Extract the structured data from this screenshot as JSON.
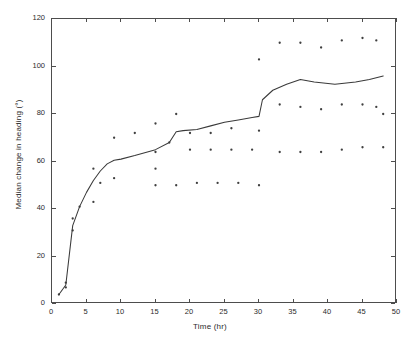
{
  "chart_data": {
    "type": "line",
    "title": "",
    "xlabel": "Time (hr)",
    "ylabel": "Median change in heading (°)",
    "xlim": [
      0,
      50
    ],
    "ylim": [
      0,
      120
    ],
    "xticks": [
      0,
      5,
      10,
      15,
      20,
      25,
      30,
      35,
      40,
      45,
      50
    ],
    "yticks": [
      0,
      20,
      40,
      60,
      80,
      100,
      120
    ],
    "grid": false,
    "legend": false,
    "legend_position": "none",
    "series": [
      {
        "name": "Median change in heading",
        "type": "line",
        "color": "#3a3a3a",
        "x": [
          1,
          2,
          3,
          4,
          5,
          6,
          7,
          8,
          9,
          10,
          12,
          15,
          17,
          18,
          19,
          21,
          23,
          25,
          27,
          29,
          30,
          30.5,
          32,
          34,
          36,
          38,
          41,
          44,
          46,
          48
        ],
        "y": [
          4,
          8,
          33,
          41,
          47,
          52,
          56,
          59,
          60.5,
          61,
          62.5,
          65,
          68,
          72.5,
          73,
          73.5,
          75,
          76.5,
          77.5,
          78.5,
          79,
          86,
          90,
          92.5,
          94.5,
          93.5,
          92.5,
          93.5,
          94.5,
          96
        ]
      },
      {
        "name": "Individual observations",
        "type": "scatter",
        "color": "#3f3f3f",
        "points": [
          [
            1,
            4
          ],
          [
            2,
            9
          ],
          [
            2,
            7
          ],
          [
            3,
            31
          ],
          [
            3,
            36
          ],
          [
            4,
            41
          ],
          [
            6,
            43
          ],
          [
            6,
            57
          ],
          [
            7,
            51
          ],
          [
            9,
            53
          ],
          [
            9,
            70
          ],
          [
            12,
            72
          ],
          [
            15,
            57
          ],
          [
            15,
            64
          ],
          [
            15,
            76
          ],
          [
            15,
            50
          ],
          [
            17,
            68
          ],
          [
            18,
            80
          ],
          [
            18,
            50
          ],
          [
            20,
            72
          ],
          [
            20,
            65
          ],
          [
            21,
            51
          ],
          [
            23,
            72
          ],
          [
            23,
            65
          ],
          [
            24,
            51
          ],
          [
            26,
            74
          ],
          [
            26,
            65
          ],
          [
            27,
            51
          ],
          [
            29,
            65
          ],
          [
            30,
            103
          ],
          [
            30,
            73
          ],
          [
            30,
            50
          ],
          [
            33,
            110
          ],
          [
            33,
            84
          ],
          [
            33,
            64
          ],
          [
            36,
            110
          ],
          [
            36,
            83
          ],
          [
            36,
            64
          ],
          [
            39,
            108
          ],
          [
            39,
            82
          ],
          [
            39,
            64
          ],
          [
            42,
            111
          ],
          [
            42,
            84
          ],
          [
            42,
            65
          ],
          [
            45,
            112
          ],
          [
            45,
            84
          ],
          [
            45,
            66
          ],
          [
            47,
            111
          ],
          [
            47,
            83
          ],
          [
            48,
            80
          ],
          [
            48,
            66
          ]
        ]
      }
    ]
  },
  "axes": {
    "x_title": "Time (hr)",
    "y_title": "Median change in heading (°)",
    "x_tick_labels": [
      "0",
      "5",
      "10",
      "15",
      "20",
      "25",
      "30",
      "35",
      "40",
      "45",
      "50"
    ],
    "y_tick_labels": [
      "0",
      "20",
      "40",
      "60",
      "80",
      "100",
      "120"
    ]
  },
  "colors": {
    "line": "#3a3a3a",
    "marker": "#3f3f3f",
    "axis": "#4d4d4d",
    "text": "#2b2b2b",
    "background": "#ffffff"
  }
}
